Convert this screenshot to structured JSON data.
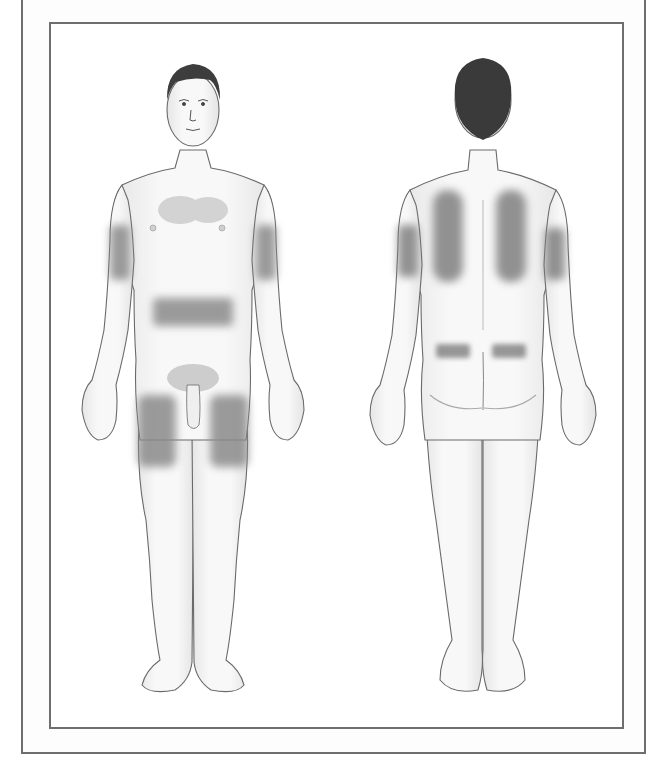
{
  "caption_partial": "…, p…, y…",
  "figure": {
    "type": "injection-site body diagram",
    "views": [
      {
        "name": "anterior",
        "label": "Front view",
        "shaded_regions": [
          "left upper arm",
          "right upper arm",
          "abdomen band",
          "left anterior thigh",
          "right anterior thigh"
        ]
      },
      {
        "name": "posterior",
        "label": "Back view",
        "shaded_regions": [
          "left upper back",
          "right upper back",
          "left posterior upper arm",
          "right posterior upper arm",
          "left upper buttock",
          "right upper buttock"
        ]
      }
    ],
    "colors": {
      "skin": "#f4f4f4",
      "outline": "#6a6a6a",
      "shade": "#8a8a8a",
      "hair": "#3a3a3a",
      "frame": "#6e6e6e"
    }
  }
}
